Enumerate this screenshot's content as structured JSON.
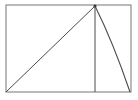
{
  "figure": {
    "title": "Geometric figure: rectangle with inscribed triangle and arc",
    "background_color": "#ffffff",
    "line_color": "#4a4a4a",
    "frame_color": "#8c8c8c",
    "vertex_color": "#3a3a3a",
    "canvas": {
      "width": 138,
      "height": 100
    },
    "frame": {
      "name": "bounding-rectangle",
      "left": 6,
      "top": 5,
      "right": 131,
      "bottom": 92,
      "width": 125,
      "height": 87
    },
    "points": {
      "bottom_left": {
        "x": 6,
        "y": 92,
        "label": "A"
      },
      "apex": {
        "x": 95,
        "y": 6,
        "label": "B"
      },
      "foot": {
        "x": 95,
        "y": 92,
        "label": "C"
      },
      "bottom_right": {
        "x": 131,
        "y": 92,
        "label": "D"
      },
      "top_left": {
        "x": 6,
        "y": 5
      },
      "top_right": {
        "x": 131,
        "y": 5
      }
    },
    "elements": [
      {
        "name": "hypotenuse-diagonal",
        "kind": "line",
        "from": "bottom_left",
        "to": "apex",
        "path": "M 6 92 L 95 6"
      },
      {
        "name": "vertical-altitude",
        "kind": "line",
        "from": "apex",
        "to": "foot",
        "path": "M 95 6 L 95 92"
      },
      {
        "name": "concave-arc",
        "kind": "curve",
        "from": "apex",
        "to": "bottom_right",
        "path": "M 95 6 Q 113 42 130 92"
      }
    ]
  }
}
